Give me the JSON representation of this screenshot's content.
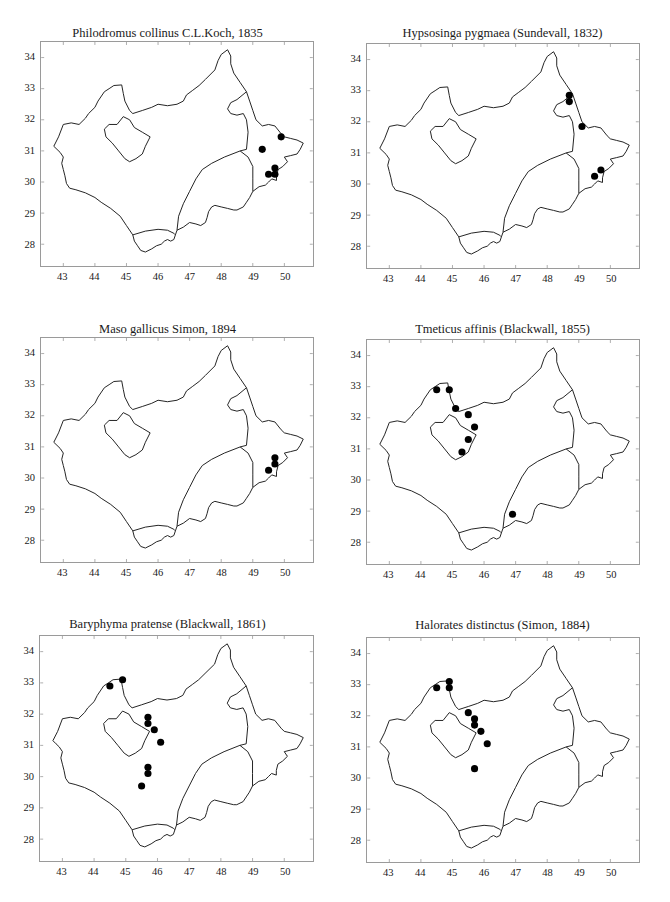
{
  "figure": {
    "layout": "3 rows x 2 columns of species distribution maps",
    "outline_color": "#222222",
    "frame_color": "#9a9a9a",
    "marker_color": "#000000"
  },
  "chart_data": [
    {
      "type": "scatter",
      "title": "Philodromus collinus C.L.Koch, 1835",
      "xlabel": "",
      "ylabel": "",
      "xlim": [
        42.3,
        50.9
      ],
      "ylim": [
        27.3,
        34.5
      ],
      "xticks": [
        43,
        44,
        45,
        46,
        47,
        48,
        49,
        50
      ],
      "yticks": [
        28,
        29,
        30,
        31,
        32,
        33,
        34
      ],
      "grid": false,
      "points": [
        [
          49.9,
          31.45
        ],
        [
          49.3,
          31.05
        ],
        [
          49.7,
          30.45
        ],
        [
          49.5,
          30.25
        ],
        [
          49.7,
          30.25
        ]
      ]
    },
    {
      "type": "scatter",
      "title": "Hypsosinga pygmaea (Sundevall, 1832)",
      "xlabel": "",
      "ylabel": "",
      "xlim": [
        42.3,
        50.9
      ],
      "ylim": [
        27.3,
        34.5
      ],
      "xticks": [
        43,
        44,
        45,
        46,
        47,
        48,
        49,
        50
      ],
      "yticks": [
        28,
        29,
        30,
        31,
        32,
        33,
        34
      ],
      "grid": false,
      "points": [
        [
          48.7,
          32.85
        ],
        [
          48.7,
          32.65
        ],
        [
          49.1,
          31.85
        ],
        [
          49.7,
          30.45
        ],
        [
          49.5,
          30.25
        ]
      ]
    },
    {
      "type": "scatter",
      "title": "Maso gallicus Simon, 1894",
      "xlabel": "",
      "ylabel": "",
      "xlim": [
        42.3,
        50.9
      ],
      "ylim": [
        27.3,
        34.5
      ],
      "xticks": [
        43,
        44,
        45,
        46,
        47,
        48,
        49,
        50
      ],
      "yticks": [
        28,
        29,
        30,
        31,
        32,
        33,
        34
      ],
      "grid": false,
      "points": [
        [
          49.7,
          30.65
        ],
        [
          49.7,
          30.45
        ],
        [
          49.5,
          30.25
        ]
      ]
    },
    {
      "type": "scatter",
      "title": "Tmeticus affinis (Blackwall, 1855)",
      "xlabel": "",
      "ylabel": "",
      "xlim": [
        42.3,
        50.9
      ],
      "ylim": [
        27.3,
        34.5
      ],
      "xticks": [
        43,
        44,
        45,
        46,
        47,
        48,
        49,
        50
      ],
      "yticks": [
        28,
        29,
        30,
        31,
        32,
        33,
        34
      ],
      "grid": false,
      "points": [
        [
          44.5,
          32.9
        ],
        [
          44.9,
          32.9
        ],
        [
          45.1,
          32.3
        ],
        [
          45.5,
          32.1
        ],
        [
          45.7,
          31.7
        ],
        [
          45.5,
          31.3
        ],
        [
          45.3,
          30.9
        ],
        [
          46.9,
          28.9
        ]
      ]
    },
    {
      "type": "scatter",
      "title": "Baryphyma pratense (Blackwall, 1861)",
      "xlabel": "",
      "ylabel": "",
      "xlim": [
        42.3,
        50.9
      ],
      "ylim": [
        27.3,
        34.5
      ],
      "xticks": [
        43,
        44,
        45,
        46,
        47,
        48,
        49,
        50
      ],
      "yticks": [
        28,
        29,
        30,
        31,
        32,
        33,
        34
      ],
      "grid": false,
      "points": [
        [
          44.5,
          32.9
        ],
        [
          44.9,
          33.1
        ],
        [
          45.7,
          31.9
        ],
        [
          45.7,
          31.7
        ],
        [
          45.9,
          31.5
        ],
        [
          46.1,
          31.1
        ],
        [
          45.7,
          30.3
        ],
        [
          45.7,
          30.1
        ],
        [
          45.5,
          29.7
        ]
      ]
    },
    {
      "type": "scatter",
      "title": "Halorates distinctus (Simon, 1884)",
      "xlabel": "",
      "ylabel": "",
      "xlim": [
        42.3,
        50.9
      ],
      "ylim": [
        27.3,
        34.5
      ],
      "xticks": [
        43,
        44,
        45,
        46,
        47,
        48,
        49,
        50
      ],
      "yticks": [
        28,
        29,
        30,
        31,
        32,
        33,
        34
      ],
      "grid": false,
      "points": [
        [
          44.5,
          32.9
        ],
        [
          44.9,
          33.1
        ],
        [
          44.9,
          32.9
        ],
        [
          45.5,
          32.1
        ],
        [
          45.7,
          31.9
        ],
        [
          45.7,
          31.7
        ],
        [
          45.9,
          31.5
        ],
        [
          46.1,
          31.1
        ],
        [
          45.7,
          30.3
        ]
      ]
    }
  ],
  "map_geometry": {
    "outer": [
      [
        42.7,
        31.15
      ],
      [
        42.85,
        31.45
      ],
      [
        43.0,
        31.85
      ],
      [
        43.25,
        31.9
      ],
      [
        43.5,
        31.85
      ],
      [
        43.7,
        32.05
      ],
      [
        43.8,
        32.2
      ],
      [
        44.0,
        32.4
      ],
      [
        44.1,
        32.6
      ],
      [
        44.3,
        32.9
      ],
      [
        44.45,
        33.0
      ],
      [
        44.6,
        33.1
      ],
      [
        44.85,
        33.12
      ],
      [
        44.9,
        32.85
      ],
      [
        44.95,
        32.6
      ],
      [
        45.1,
        32.3
      ],
      [
        45.2,
        32.2
      ],
      [
        45.5,
        32.3
      ],
      [
        45.8,
        32.4
      ],
      [
        46.0,
        32.5
      ],
      [
        46.3,
        32.45
      ],
      [
        46.6,
        32.5
      ],
      [
        46.8,
        32.6
      ],
      [
        46.9,
        32.8
      ],
      [
        47.1,
        32.95
      ],
      [
        47.3,
        33.1
      ],
      [
        47.5,
        33.3
      ],
      [
        47.8,
        33.6
      ],
      [
        47.9,
        33.9
      ],
      [
        48.0,
        34.1
      ],
      [
        48.2,
        34.25
      ],
      [
        48.3,
        34.05
      ],
      [
        48.3,
        33.8
      ],
      [
        48.4,
        33.5
      ],
      [
        48.6,
        33.2
      ],
      [
        48.8,
        32.9
      ],
      [
        48.9,
        32.6
      ],
      [
        49.0,
        32.3
      ],
      [
        49.1,
        32.0
      ],
      [
        49.3,
        31.8
      ],
      [
        49.5,
        31.85
      ],
      [
        49.7,
        31.8
      ],
      [
        49.9,
        31.55
      ],
      [
        50.0,
        31.45
      ],
      [
        50.2,
        31.4
      ],
      [
        50.4,
        31.35
      ],
      [
        50.6,
        31.25
      ],
      [
        50.5,
        31.05
      ],
      [
        50.4,
        30.9
      ],
      [
        50.2,
        30.85
      ],
      [
        50.0,
        30.8
      ],
      [
        50.1,
        30.65
      ],
      [
        49.95,
        30.5
      ],
      [
        49.8,
        30.4
      ],
      [
        49.75,
        30.2
      ],
      [
        49.75,
        30.05
      ],
      [
        49.6,
        30.1
      ],
      [
        49.5,
        30.0
      ],
      [
        49.4,
        29.9
      ],
      [
        49.2,
        29.85
      ],
      [
        49.0,
        29.7
      ],
      [
        48.9,
        29.5
      ],
      [
        48.8,
        29.35
      ],
      [
        48.7,
        29.2
      ],
      [
        48.5,
        29.1
      ],
      [
        48.4,
        29.1
      ],
      [
        48.2,
        29.15
      ],
      [
        48.0,
        29.2
      ],
      [
        47.8,
        29.25
      ],
      [
        47.7,
        29.2
      ],
      [
        47.6,
        29.05
      ],
      [
        47.55,
        28.85
      ],
      [
        47.5,
        28.7
      ],
      [
        47.35,
        28.6
      ],
      [
        47.2,
        28.65
      ],
      [
        47.0,
        28.7
      ],
      [
        46.8,
        28.55
      ],
      [
        46.6,
        28.45
      ],
      [
        46.55,
        28.3
      ],
      [
        46.5,
        28.15
      ],
      [
        46.4,
        28.1
      ],
      [
        46.3,
        28.15
      ],
      [
        46.2,
        28.1
      ],
      [
        46.1,
        28.0
      ],
      [
        45.95,
        27.95
      ],
      [
        45.8,
        27.85
      ],
      [
        45.6,
        27.75
      ],
      [
        45.45,
        27.8
      ],
      [
        45.35,
        27.95
      ],
      [
        45.25,
        28.1
      ],
      [
        45.2,
        28.3
      ],
      [
        45.0,
        28.6
      ],
      [
        44.8,
        28.9
      ],
      [
        44.5,
        29.15
      ],
      [
        44.2,
        29.35
      ],
      [
        44.0,
        29.5
      ],
      [
        43.7,
        29.65
      ],
      [
        43.4,
        29.75
      ],
      [
        43.2,
        29.8
      ],
      [
        43.1,
        29.95
      ],
      [
        43.05,
        30.2
      ],
      [
        43.0,
        30.4
      ],
      [
        42.95,
        30.6
      ],
      [
        43.0,
        30.8
      ],
      [
        42.9,
        30.95
      ],
      [
        42.8,
        31.05
      ],
      [
        42.7,
        31.15
      ]
    ],
    "inner_lake": [
      [
        44.3,
        31.7
      ],
      [
        44.45,
        31.85
      ],
      [
        44.7,
        31.85
      ],
      [
        44.9,
        32.1
      ],
      [
        45.1,
        32.0
      ],
      [
        45.25,
        31.75
      ],
      [
        45.5,
        31.6
      ],
      [
        45.75,
        31.45
      ],
      [
        45.6,
        31.15
      ],
      [
        45.5,
        30.9
      ],
      [
        45.3,
        30.75
      ],
      [
        45.1,
        30.65
      ],
      [
        44.95,
        30.75
      ],
      [
        44.75,
        31.0
      ],
      [
        44.55,
        31.25
      ],
      [
        44.35,
        31.45
      ],
      [
        44.3,
        31.7
      ]
    ],
    "border_south_arc": [
      [
        45.2,
        28.3
      ],
      [
        45.6,
        28.42
      ],
      [
        46.0,
        28.48
      ],
      [
        46.3,
        28.45
      ],
      [
        46.5,
        28.35
      ],
      [
        46.55,
        28.3
      ]
    ],
    "border_central": [
      [
        46.6,
        28.45
      ],
      [
        46.65,
        28.9
      ],
      [
        46.8,
        29.3
      ],
      [
        47.0,
        29.7
      ],
      [
        47.2,
        30.1
      ],
      [
        47.4,
        30.4
      ],
      [
        47.7,
        30.6
      ],
      [
        48.1,
        30.8
      ],
      [
        48.6,
        31.0
      ],
      [
        48.8,
        31.05
      ],
      [
        48.85,
        31.6
      ],
      [
        48.8,
        32.0
      ],
      [
        48.7,
        32.2
      ],
      [
        48.5,
        32.15
      ],
      [
        48.3,
        32.2
      ],
      [
        48.2,
        32.35
      ],
      [
        48.3,
        32.55
      ],
      [
        48.5,
        32.65
      ],
      [
        48.8,
        32.9
      ]
    ],
    "border_east": [
      [
        48.6,
        31.0
      ],
      [
        48.85,
        30.8
      ],
      [
        49.0,
        30.5
      ],
      [
        49.0,
        30.1
      ],
      [
        49.0,
        29.7
      ]
    ]
  }
}
